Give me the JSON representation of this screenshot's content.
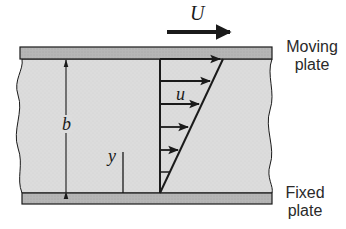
{
  "figure": {
    "type": "couette-flow-diagram",
    "colors": {
      "plate_fill": "#b8b8b8",
      "fluid_fill": "#dcdcdc",
      "stroke": "#1a1a1a",
      "background": "#ffffff"
    }
  },
  "labels": {
    "velocity_U": "U",
    "velocity_u": "u",
    "gap_b": "b",
    "coord_y": "y",
    "moving_plate_line1": "Moving",
    "moving_plate_line2": "plate",
    "fixed_plate_line1": "Fixed",
    "fixed_plate_line2": "plate"
  },
  "profile": {
    "shape": "linear",
    "arrow_count": 6,
    "arrow_heights_px": [
      59,
      81,
      104,
      127,
      150,
      172
    ]
  }
}
